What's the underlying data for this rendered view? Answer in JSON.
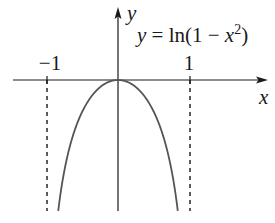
{
  "chart_data": {
    "type": "line",
    "function": "ln(1 - x^2)",
    "equation_label": {
      "lhs": "y",
      "eq": " = ln(1 − ",
      "var": "x",
      "sup": "2",
      "close": ")"
    },
    "xlabel": "x",
    "ylabel": "y",
    "x_ticks": [
      {
        "value": -1,
        "label": "−1"
      },
      {
        "value": 1,
        "label": "1"
      }
    ],
    "asymptotes": [
      {
        "x": -1,
        "style": "dashed"
      },
      {
        "x": 1,
        "style": "dashed"
      }
    ],
    "domain": [
      -1,
      1
    ],
    "xlim": [
      -1.6,
      2.1
    ],
    "ylim": [
      -1.2,
      0.7
    ],
    "grid": false,
    "legend": "none",
    "series": [
      {
        "name": "y = ln(1 − x²)",
        "x": [
          -0.83,
          -0.75,
          -0.6,
          -0.45,
          -0.3,
          -0.15,
          0,
          0.15,
          0.3,
          0.45,
          0.6,
          0.75,
          0.83
        ],
        "values": [
          -1.15,
          -0.83,
          -0.45,
          -0.23,
          -0.09,
          -0.02,
          0,
          -0.02,
          -0.09,
          -0.23,
          -0.45,
          -0.83,
          -1.15
        ]
      }
    ],
    "colors": {
      "axes": "#1a1a1a",
      "curve": "#555555",
      "asymptote": "#333333"
    }
  }
}
